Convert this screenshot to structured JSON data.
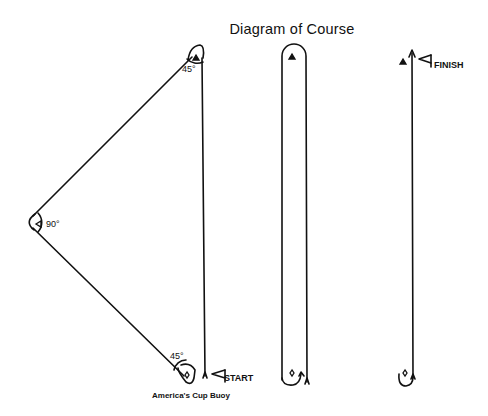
{
  "title": "Diagram of Course",
  "triangle_course": {
    "angles": {
      "top": "45°",
      "left": "90°",
      "bottom": "45°"
    },
    "start_label": "START",
    "buoy_label": "America's Cup Buoy"
  },
  "windward_leeward_course": {
    "marks": [
      "triangle-mark-top",
      "diamond-mark-bottom"
    ]
  },
  "finish_leg": {
    "finish_label": "FINISH"
  },
  "colors": {
    "line": "#111111",
    "background": "#ffffff"
  }
}
